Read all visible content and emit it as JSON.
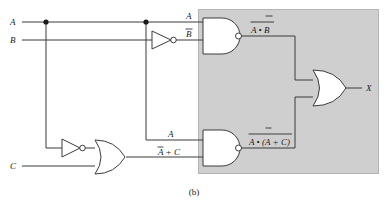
{
  "figure": {
    "caption": "(b)",
    "type": "logic-circuit-diagram"
  },
  "inputs": [
    {
      "id": "A",
      "label": "A"
    },
    {
      "id": "B",
      "label": "B"
    },
    {
      "id": "C",
      "label": "C"
    }
  ],
  "output": {
    "id": "X",
    "label": "X"
  },
  "wire_labels": {
    "nand_top_in_a": "A",
    "nand_top_in_bbar": "B",
    "nand_bottom_in_a": "A",
    "or_low_out": "A + C",
    "or_low_out_inverted_term": "A",
    "nand_top_out_expr": "A • B",
    "nand_bottom_out_expr": "A • (A + C)"
  },
  "gates": [
    {
      "id": "inv-b",
      "type": "inverter",
      "input": "B",
      "output": "B-bar"
    },
    {
      "id": "inv-a",
      "type": "inverter",
      "input": "A",
      "output": "A-bar"
    },
    {
      "id": "or-low",
      "type": "or",
      "inputs": [
        "A-bar",
        "C"
      ],
      "output": "A-bar + C"
    },
    {
      "id": "nand-top",
      "type": "nand",
      "inputs": [
        "A",
        "B-bar"
      ],
      "output": "not(A . B-bar)"
    },
    {
      "id": "nand-bottom",
      "type": "nand",
      "inputs": [
        "A",
        "A-bar + C"
      ],
      "output": "not(A . (A-bar + C))"
    },
    {
      "id": "or-final",
      "type": "or",
      "inputs": [
        "not(A . B-bar)",
        "not(A . (A-bar + C))"
      ],
      "output": "X"
    }
  ],
  "colors": {
    "wire": "#3b3b3b",
    "shade": "#cfcfcf",
    "text": "#1a1a1a",
    "background": "#ffffff"
  }
}
